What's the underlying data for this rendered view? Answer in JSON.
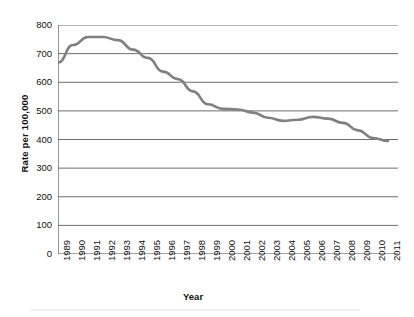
{
  "chart_data": {
    "type": "line",
    "title": "",
    "xlabel": "Year",
    "ylabel": "Rate per 100,000",
    "x": [
      1989,
      1990,
      1991,
      1992,
      1993,
      1994,
      1995,
      1996,
      1997,
      1998,
      1999,
      2000,
      2001,
      2002,
      2003,
      2004,
      2005,
      2006,
      2007,
      2008,
      2009,
      2010,
      2011
    ],
    "categories": [
      "1989",
      "1990",
      "1991",
      "1992",
      "1993",
      "1994",
      "1995",
      "1996",
      "1997",
      "1998",
      "1999",
      "2000",
      "2001",
      "2002",
      "2003",
      "2004",
      "2005",
      "2006",
      "2007",
      "2008",
      "2009",
      "2010",
      "2011"
    ],
    "values": [
      668,
      730,
      758,
      758,
      747,
      714,
      685,
      637,
      611,
      568,
      523,
      507,
      505,
      494,
      476,
      465,
      469,
      479,
      473,
      458,
      432,
      405,
      395
    ],
    "ylim": [
      0,
      800
    ],
    "yticks": [
      0,
      100,
      200,
      300,
      400,
      500,
      600,
      700,
      800
    ],
    "ytick_labels": [
      "0",
      "100",
      "200",
      "300",
      "400",
      "500",
      "600",
      "700",
      "800"
    ],
    "grid": true,
    "legend": false,
    "series": [
      {
        "name": "Rate per 100,000",
        "color": "#7f7f7f",
        "values": [
          668,
          730,
          758,
          758,
          747,
          714,
          685,
          637,
          611,
          568,
          523,
          507,
          505,
          494,
          476,
          465,
          469,
          479,
          473,
          458,
          432,
          405,
          395
        ]
      }
    ],
    "line_color": "#808080",
    "grid_color": "#6e6e6e",
    "axis_color": "#4d4d4d"
  }
}
